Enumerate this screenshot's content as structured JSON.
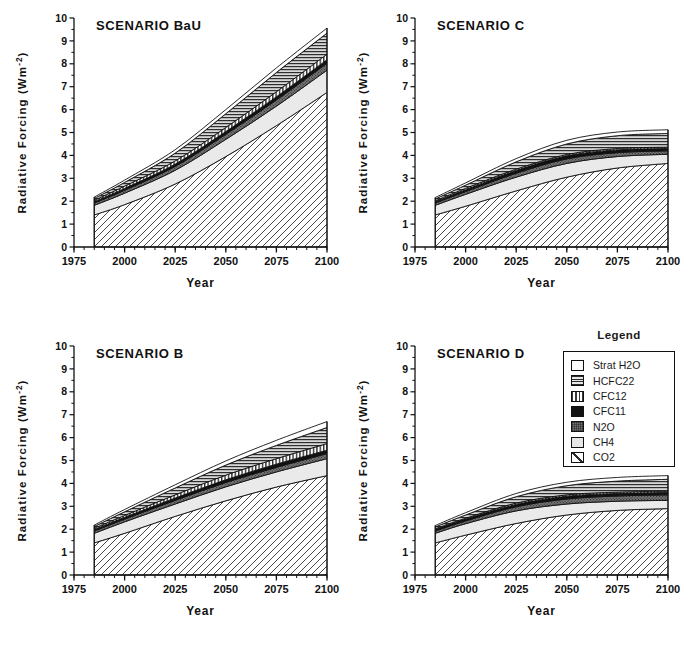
{
  "figure": {
    "axis_labels": {
      "y": "Radiative  Forcing  (Wm",
      "y_sup": "-2",
      "y_close": ")",
      "x": "Year"
    }
  },
  "legend": {
    "title": "Legend",
    "items": [
      {
        "label": "Strat H2O",
        "pattern": "white",
        "swatch_class": "sw-white"
      },
      {
        "label": "HCFC22",
        "pattern": "horizontal-lines",
        "swatch_class": "sw-horiz"
      },
      {
        "label": "CFC12",
        "pattern": "vertical-lines",
        "swatch_class": "sw-vert"
      },
      {
        "label": "CFC11",
        "pattern": "solid-black",
        "swatch_class": "sw-black"
      },
      {
        "label": "N2O",
        "pattern": "dark-stipple",
        "swatch_class": "sw-n2o"
      },
      {
        "label": "CH4",
        "pattern": "light-gray",
        "swatch_class": "sw-ch4"
      },
      {
        "label": "CO2",
        "pattern": "diagonal-hatch",
        "swatch_class": "sw-co2"
      }
    ]
  },
  "chart_data": [
    {
      "type": "area",
      "id": "bau",
      "title": "SCENARIO BaU",
      "xlabel": "Year",
      "ylabel": "Radiative  Forcing  (Wm-2)",
      "xlim": [
        1975,
        2100
      ],
      "ylim": [
        0,
        10
      ],
      "xticks": [
        1975,
        2000,
        2025,
        2050,
        2075,
        2100
      ],
      "yticks": [
        0,
        1,
        2,
        3,
        4,
        5,
        6,
        7,
        8,
        9,
        10
      ],
      "minor_x_step": 5,
      "grid": false,
      "legend_position": "external-right",
      "x": [
        1985,
        2000,
        2025,
        2050,
        2075,
        2100
      ],
      "series": [
        {
          "name": "CO2",
          "cumulative": [
            1.4,
            1.85,
            2.75,
            3.95,
            5.3,
            6.75
          ]
        },
        {
          "name": "CH4",
          "cumulative": [
            1.82,
            2.35,
            3.35,
            4.7,
            6.15,
            7.72
          ]
        },
        {
          "name": "N2O",
          "cumulative": [
            1.92,
            2.48,
            3.52,
            4.92,
            6.42,
            8.02
          ]
        },
        {
          "name": "CFC11",
          "cumulative": [
            1.98,
            2.56,
            3.62,
            5.04,
            6.56,
            8.18
          ]
        },
        {
          "name": "CFC12",
          "cumulative": [
            2.04,
            2.66,
            3.76,
            5.22,
            6.78,
            8.42
          ]
        },
        {
          "name": "HCFC22",
          "cumulative": [
            2.12,
            2.82,
            4.1,
            5.82,
            7.62,
            9.34
          ]
        },
        {
          "name": "Strat H2O",
          "cumulative": [
            2.18,
            2.92,
            4.25,
            6.0,
            7.82,
            9.56
          ]
        }
      ]
    },
    {
      "type": "area",
      "id": "c",
      "title": "SCENARIO C",
      "xlabel": "Year",
      "ylabel": "Radiative  Forcing  (Wm-2)",
      "xlim": [
        1975,
        2100
      ],
      "ylim": [
        0,
        10
      ],
      "xticks": [
        1975,
        2000,
        2025,
        2050,
        2075,
        2100
      ],
      "yticks": [
        0,
        1,
        2,
        3,
        4,
        5,
        6,
        7,
        8,
        9,
        10
      ],
      "minor_x_step": 5,
      "grid": false,
      "legend_position": "external-right",
      "x": [
        1985,
        2000,
        2025,
        2050,
        2075,
        2100
      ],
      "series": [
        {
          "name": "CO2",
          "cumulative": [
            1.4,
            1.78,
            2.45,
            3.05,
            3.45,
            3.65
          ]
        },
        {
          "name": "CH4",
          "cumulative": [
            1.82,
            2.3,
            3.05,
            3.65,
            3.95,
            4.05
          ]
        },
        {
          "name": "N2O",
          "cumulative": [
            1.92,
            2.42,
            3.22,
            3.85,
            4.12,
            4.2
          ]
        },
        {
          "name": "CFC11",
          "cumulative": [
            1.98,
            2.5,
            3.34,
            3.98,
            4.24,
            4.3
          ]
        },
        {
          "name": "CFC12",
          "cumulative": [
            2.02,
            2.56,
            3.4,
            4.04,
            4.3,
            4.36
          ]
        },
        {
          "name": "HCFC22",
          "cumulative": [
            2.1,
            2.7,
            3.72,
            4.5,
            4.86,
            4.96
          ]
        },
        {
          "name": "Strat H2O",
          "cumulative": [
            2.16,
            2.8,
            3.86,
            4.66,
            5.02,
            5.12
          ]
        }
      ]
    },
    {
      "type": "area",
      "id": "b",
      "title": "SCENARIO B",
      "xlabel": "Year",
      "ylabel": "Radiative  Forcing  (Wm-2)",
      "xlim": [
        1975,
        2100
      ],
      "ylim": [
        0,
        10
      ],
      "xticks": [
        1975,
        2000,
        2025,
        2050,
        2075,
        2100
      ],
      "yticks": [
        0,
        1,
        2,
        3,
        4,
        5,
        6,
        7,
        8,
        9,
        10
      ],
      "minor_x_step": 5,
      "grid": false,
      "legend_position": "external-right",
      "x": [
        1985,
        2000,
        2025,
        2050,
        2075,
        2100
      ],
      "series": [
        {
          "name": "CO2",
          "cumulative": [
            1.4,
            1.82,
            2.56,
            3.24,
            3.84,
            4.34
          ]
        },
        {
          "name": "CH4",
          "cumulative": [
            1.82,
            2.32,
            3.1,
            3.85,
            4.5,
            5.08
          ]
        },
        {
          "name": "N2O",
          "cumulative": [
            1.92,
            2.44,
            3.26,
            4.04,
            4.7,
            5.3
          ]
        },
        {
          "name": "CFC11",
          "cumulative": [
            1.98,
            2.52,
            3.36,
            4.16,
            4.84,
            5.45
          ]
        },
        {
          "name": "CFC12",
          "cumulative": [
            2.04,
            2.6,
            3.5,
            4.36,
            5.08,
            5.74
          ]
        },
        {
          "name": "HCFC22",
          "cumulative": [
            2.12,
            2.76,
            3.8,
            4.8,
            5.66,
            6.44
          ]
        },
        {
          "name": "Strat H2O",
          "cumulative": [
            2.18,
            2.86,
            3.94,
            4.98,
            5.88,
            6.7
          ]
        }
      ]
    },
    {
      "type": "area",
      "id": "d",
      "title": "SCENARIO D",
      "xlabel": "Year",
      "ylabel": "Radiative  Forcing  (Wm-2)",
      "xlim": [
        1975,
        2100
      ],
      "ylim": [
        0,
        10
      ],
      "xticks": [
        1975,
        2000,
        2025,
        2050,
        2075,
        2100
      ],
      "yticks": [
        0,
        1,
        2,
        3,
        4,
        5,
        6,
        7,
        8,
        9,
        10
      ],
      "minor_x_step": 5,
      "grid": false,
      "legend_position": "external-right",
      "x": [
        1985,
        2000,
        2025,
        2050,
        2075,
        2100
      ],
      "series": [
        {
          "name": "CO2",
          "cumulative": [
            1.4,
            1.74,
            2.25,
            2.62,
            2.82,
            2.9
          ]
        },
        {
          "name": "CH4",
          "cumulative": [
            1.82,
            2.24,
            2.8,
            3.1,
            3.22,
            3.26
          ]
        },
        {
          "name": "N2O",
          "cumulative": [
            1.92,
            2.36,
            2.98,
            3.32,
            3.45,
            3.5
          ]
        },
        {
          "name": "CFC11",
          "cumulative": [
            1.98,
            2.44,
            3.08,
            3.44,
            3.56,
            3.6
          ]
        },
        {
          "name": "CFC12",
          "cumulative": [
            2.02,
            2.48,
            3.14,
            3.5,
            3.62,
            3.66
          ]
        },
        {
          "name": "HCFC22",
          "cumulative": [
            2.1,
            2.62,
            3.42,
            3.9,
            4.1,
            4.18
          ]
        },
        {
          "name": "Strat H2O",
          "cumulative": [
            2.16,
            2.72,
            3.56,
            4.05,
            4.26,
            4.34
          ]
        }
      ]
    }
  ]
}
